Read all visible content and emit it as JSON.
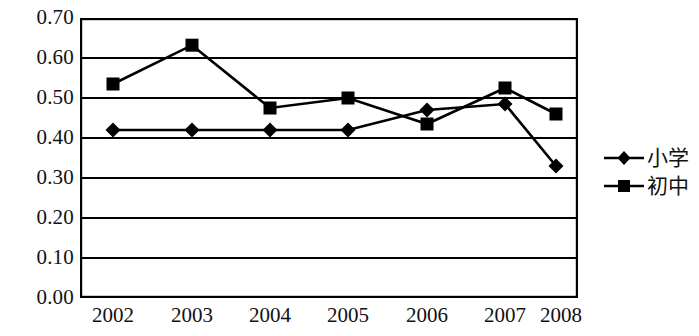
{
  "chart_data": {
    "type": "line",
    "title": "",
    "subtitle": "",
    "xlabel": "",
    "ylabel": "",
    "categories": [
      "2002",
      "2003",
      "2004",
      "2005",
      "2006",
      "2007",
      "2008"
    ],
    "series": [
      {
        "name": "小学",
        "marker": "diamond",
        "values": [
          0.42,
          0.42,
          0.42,
          0.42,
          0.47,
          0.485,
          0.33
        ]
      },
      {
        "name": "初中",
        "marker": "square",
        "values": [
          0.535,
          0.632,
          0.475,
          0.5,
          0.435,
          0.525,
          0.46
        ]
      }
    ],
    "ylim": [
      0.0,
      0.7
    ],
    "y_ticks": [
      "0.70",
      "0.60",
      "0.50",
      "0.40",
      "0.30",
      "0.20",
      "0.10",
      "0.00"
    ],
    "y_tick_values": [
      0.7,
      0.6,
      0.5,
      0.4,
      0.3,
      0.2,
      0.1,
      0.0
    ],
    "grid": "horizontal",
    "legend_position": "right",
    "colors": {
      "line": "#000000",
      "marker": "#000000",
      "grid": "#000000",
      "plot_border": "#000000",
      "background": "#ffffff"
    }
  },
  "legend": {
    "items": [
      {
        "label": "小学",
        "marker": "diamond"
      },
      {
        "label": "初中",
        "marker": "square"
      }
    ]
  }
}
